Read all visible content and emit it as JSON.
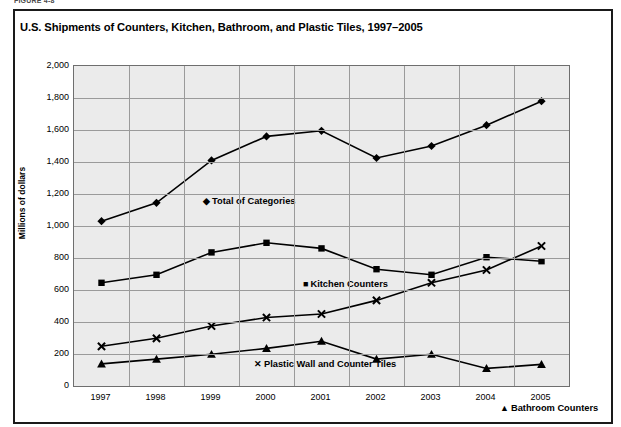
{
  "figure": {
    "number_label": "FIGURE 4-8",
    "title": "U.S. Shipments of Counters, Kitchen, Bathroom, and Plastic Tiles, 1997–2005"
  },
  "axes": {
    "y_title": "Millions of dollars",
    "y_ticks": [
      "2,000",
      "1,800",
      "1,600",
      "1,400",
      "1,200",
      "1,000",
      "800",
      "600",
      "400",
      "200",
      "0"
    ],
    "x_ticks": [
      "1997",
      "1998",
      "1999",
      "2000",
      "2001",
      "2002",
      "2003",
      "2004",
      "2005"
    ]
  },
  "series_labels": {
    "total": {
      "marker": "◆",
      "marker_name": "diamond-marker",
      "text": "Total of Categories"
    },
    "kitchen": {
      "marker": "■",
      "marker_name": "square-marker",
      "text": "Kitchen Counters"
    },
    "plastic": {
      "marker": "✕",
      "marker_name": "x-marker",
      "text": "Plastic Wall and Counter Tiles"
    },
    "bathroom": {
      "marker": "▲",
      "marker_name": "triangle-marker",
      "text": "Bathroom Counters"
    }
  },
  "colors": {
    "plot_background": "#ebebeb",
    "gridline": "#9a9a9a",
    "line": "#000000",
    "border": "#1a1a1a"
  },
  "chart_data": {
    "type": "line",
    "title": "U.S. Shipments of Counters, Kitchen, Bathroom, and Plastic Tiles, 1997–2005",
    "xlabel": "",
    "ylabel": "Millions of dollars",
    "x": [
      1997,
      1998,
      1999,
      2000,
      2001,
      2002,
      2003,
      2004,
      2005
    ],
    "categories": [
      "1997",
      "1998",
      "1999",
      "2000",
      "2001",
      "2002",
      "2003",
      "2004",
      "2005"
    ],
    "ylim": [
      0,
      2000
    ],
    "ytick_step": 200,
    "grid": true,
    "legend": "inline-labels",
    "series": [
      {
        "name": "Total of Categories",
        "marker": "diamond",
        "values": [
          1030,
          1145,
          1410,
          1560,
          1595,
          1425,
          1500,
          1630,
          1780
        ]
      },
      {
        "name": "Kitchen Counters",
        "marker": "square",
        "values": [
          645,
          695,
          835,
          895,
          860,
          730,
          695,
          805,
          780
        ]
      },
      {
        "name": "Plastic Wall and Counter Tiles",
        "marker": "x",
        "values": [
          248,
          298,
          375,
          428,
          450,
          535,
          645,
          725,
          875
        ]
      },
      {
        "name": "Bathroom Counters",
        "marker": "triangle",
        "values": [
          138,
          168,
          198,
          235,
          280,
          168,
          198,
          110,
          135
        ]
      }
    ]
  }
}
